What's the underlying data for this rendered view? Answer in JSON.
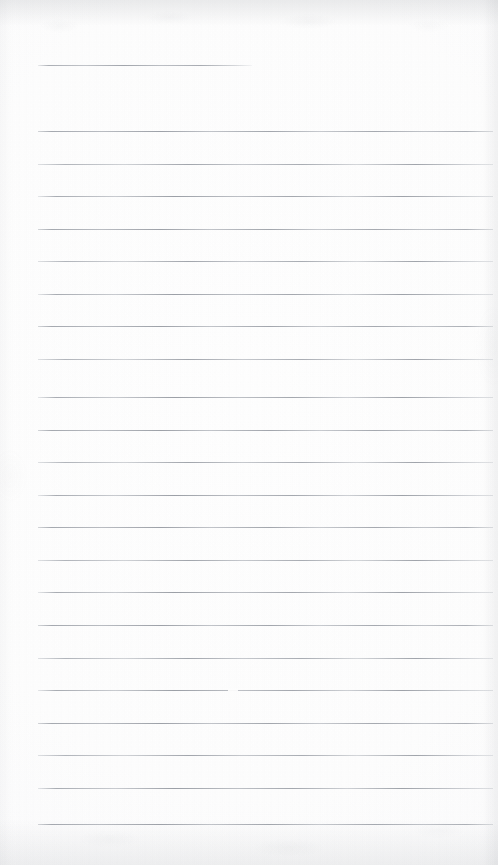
{
  "document": {
    "kind": "scanned-lined-notebook-page",
    "page_label": "",
    "width_px": 498,
    "height_px": 865,
    "body_text": "",
    "handwriting": "",
    "colors": {
      "paper": "#fdfdfd",
      "rule_line": "#a4a8af",
      "edge_shadow": "#8c9096"
    }
  },
  "ruling": {
    "left_x": 38,
    "right_x": 493,
    "spacing_px": 32.5,
    "line_count": 25,
    "header_rule": {
      "y": 65,
      "left_x": 38,
      "right_x": 252
    },
    "lines": [
      {
        "y": 65,
        "x1": 38,
        "x2": 252,
        "variant": "short"
      },
      {
        "y": 131,
        "x1": 38,
        "x2": 493,
        "variant": "v1"
      },
      {
        "y": 164,
        "x1": 38,
        "x2": 493,
        "variant": "v2"
      },
      {
        "y": 196,
        "x1": 38,
        "x2": 493,
        "variant": "v3"
      },
      {
        "y": 229,
        "x1": 38,
        "x2": 493,
        "variant": "v1"
      },
      {
        "y": 261,
        "x1": 38,
        "x2": 493,
        "variant": "v2"
      },
      {
        "y": 294,
        "x1": 38,
        "x2": 493,
        "variant": "v3"
      },
      {
        "y": 326,
        "x1": 38,
        "x2": 493,
        "variant": "v1"
      },
      {
        "y": 359,
        "x1": 38,
        "x2": 493,
        "variant": "v2"
      },
      {
        "y": 397,
        "x1": 38,
        "x2": 493,
        "variant": "v3"
      },
      {
        "y": 430,
        "x1": 38,
        "x2": 493,
        "variant": "v1"
      },
      {
        "y": 462,
        "x1": 38,
        "x2": 493,
        "variant": "v2"
      },
      {
        "y": 495,
        "x1": 38,
        "x2": 493,
        "variant": "v3"
      },
      {
        "y": 527,
        "x1": 38,
        "x2": 493,
        "variant": "v1"
      },
      {
        "y": 560,
        "x1": 38,
        "x2": 493,
        "variant": "v2"
      },
      {
        "y": 592,
        "x1": 38,
        "x2": 493,
        "variant": "v3"
      },
      {
        "y": 625,
        "x1": 38,
        "x2": 493,
        "variant": "v1"
      },
      {
        "y": 658,
        "x1": 38,
        "x2": 493,
        "variant": "v2"
      },
      {
        "y": 690,
        "x1": 38,
        "x2": 493,
        "variant": "v3"
      },
      {
        "y": 723,
        "x1": 38,
        "x2": 493,
        "variant": "v1"
      },
      {
        "y": 755,
        "x1": 38,
        "x2": 493,
        "variant": "v2"
      },
      {
        "y": 788,
        "x1": 38,
        "x2": 493,
        "variant": "v3"
      },
      {
        "y": 824,
        "x1": 38,
        "x2": 493,
        "variant": "v1"
      }
    ]
  },
  "artifacts": {
    "scan_dropouts": [
      {
        "x": 228,
        "y": 689,
        "width": 10
      }
    ],
    "edge_shadows": [
      "top",
      "bottom",
      "right",
      "left"
    ]
  }
}
